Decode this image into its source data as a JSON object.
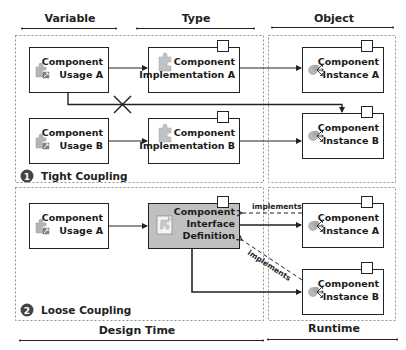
{
  "headers": {
    "variable": "Variable",
    "type": "Type",
    "object": "Object"
  },
  "footers": {
    "design_time": "Design Time",
    "runtime": "Runtime"
  },
  "tight": {
    "badge": "1",
    "title": "Tight Coupling",
    "usage_a": [
      "Component",
      "Usage A"
    ],
    "usage_b": [
      "Component",
      "Usage B"
    ],
    "impl_a": [
      "Component",
      "Implementation A"
    ],
    "impl_b": [
      "Component",
      "Implementation B"
    ],
    "instance_a": [
      "Component",
      "Instance A"
    ],
    "instance_b": [
      "Component",
      "Instance B"
    ]
  },
  "loose": {
    "badge": "2",
    "title": "Loose Coupling",
    "usage_a": [
      "Component",
      "Usage A"
    ],
    "definition": [
      "Component",
      "Interface",
      "Definition"
    ],
    "instance_a": [
      "Component",
      "Instance A"
    ],
    "instance_b": [
      "Component",
      "Instance B"
    ],
    "implements_label_a": "implements",
    "implements_label_b": "implements"
  },
  "colors": {
    "line": "#222222",
    "dashed_border": "#777777",
    "definition_fill": "#c0c0c0",
    "badge_fill": "#444444",
    "icon_gray": "#9a9a9a"
  }
}
